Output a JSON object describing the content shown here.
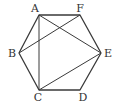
{
  "diagram": {
    "title": "",
    "stroke_color": "#3a3a3a",
    "label_color": "#333333",
    "vertices": [
      {
        "id": "A",
        "label": "A",
        "x": 39,
        "y": 15,
        "lx": 35,
        "ly": 12
      },
      {
        "id": "F",
        "label": "F",
        "x": 80,
        "y": 15,
        "lx": 80,
        "ly": 12
      },
      {
        "id": "E",
        "label": "E",
        "x": 101,
        "y": 53,
        "lx": 108,
        "ly": 57
      },
      {
        "id": "D",
        "label": "D",
        "x": 80,
        "y": 90,
        "lx": 83,
        "ly": 101
      },
      {
        "id": "C",
        "label": "C",
        "x": 39,
        "y": 90,
        "lx": 38,
        "ly": 101
      },
      {
        "id": "B",
        "label": "B",
        "x": 19,
        "y": 53,
        "lx": 12,
        "ly": 57
      }
    ],
    "hexagon_order": [
      "A",
      "F",
      "E",
      "D",
      "C",
      "B"
    ],
    "diagonals": [
      [
        "A",
        "C"
      ],
      [
        "A",
        "E"
      ],
      [
        "B",
        "F"
      ],
      [
        "C",
        "E"
      ]
    ]
  }
}
